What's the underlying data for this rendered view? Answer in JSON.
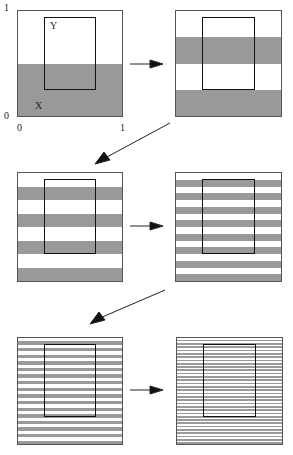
{
  "figure": {
    "axis_labels": {
      "y_top": "1",
      "y_bottom": "0",
      "x_left": "0",
      "x_right": "1"
    },
    "set_labels": {
      "Y": "Y",
      "X": "X"
    },
    "colors": {
      "shade": "#999999",
      "border": "#555555",
      "ybox": "#111111"
    },
    "panels": [
      {
        "id": 1,
        "x": 17,
        "y": 10,
        "w": 106,
        "h": 107,
        "stripes": 1,
        "description": "X = bottom half shaded"
      },
      {
        "id": 2,
        "x": 175,
        "y": 10,
        "w": 107,
        "h": 107,
        "stripes": 2
      },
      {
        "id": 3,
        "x": 17,
        "y": 172,
        "w": 106,
        "h": 110,
        "stripes": 4
      },
      {
        "id": 4,
        "x": 175,
        "y": 172,
        "w": 107,
        "h": 110,
        "stripes": 8
      },
      {
        "id": 5,
        "x": 17,
        "y": 337,
        "w": 106,
        "h": 108,
        "stripes": 16
      },
      {
        "id": 6,
        "x": 176,
        "y": 337,
        "w": 107,
        "h": 108,
        "stripes": 32
      }
    ],
    "ybox": {
      "left_frac": 0.25,
      "right_frac": 0.75,
      "top_frac": 0.06,
      "bottom_frac": 0.75
    }
  }
}
